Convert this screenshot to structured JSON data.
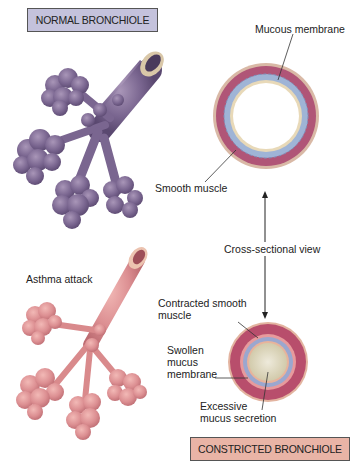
{
  "titles": {
    "normal": "NORMAL BRONCHIOLE",
    "constricted": "CONSTRICTED BRONCHIOLE"
  },
  "labels": {
    "mucous_membrane": "Mucous membrane",
    "smooth_muscle": "Smooth muscle",
    "cross_sectional_view": "Cross-sectional view",
    "asthma_attack": "Asthma attack",
    "contracted_smooth_muscle_1": "Contracted smooth",
    "contracted_smooth_muscle_2": "muscle",
    "swollen_1": "Swollen",
    "swollen_2": "mucus",
    "swollen_3": "membrane",
    "excessive_1": "Excessive",
    "excessive_2": "mucus secretion"
  },
  "colors": {
    "normal_bronchiole": "#7e6a92",
    "constricted_bronchiole": "#d98a8c",
    "normal_title_bg": "#c4c2dc",
    "constricted_title_bg": "#e9b4a6",
    "muscle": "#b05577",
    "mucosa": "#9fb4d6",
    "mucus": "#ddd8be"
  }
}
